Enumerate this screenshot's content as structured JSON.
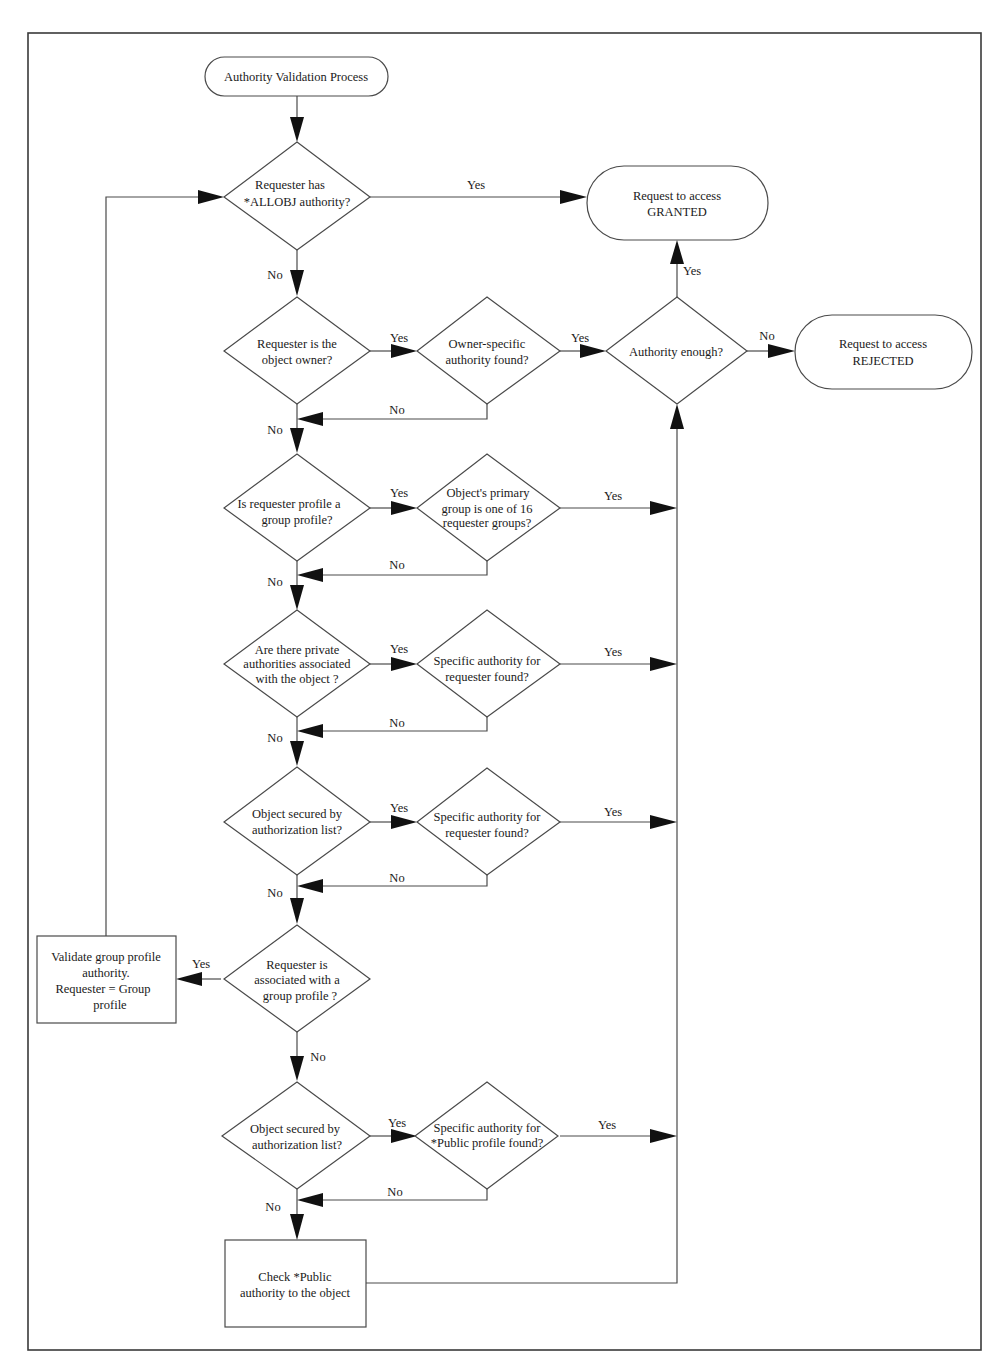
{
  "diagram": {
    "type": "flowchart",
    "title": "Authority Validation Process",
    "nodes": {
      "start": {
        "kind": "terminal",
        "lines": [
          "Authority Validation Process"
        ]
      },
      "d_allobj": {
        "kind": "decision",
        "lines": [
          "Requester has",
          "*ALLOBJ authority?"
        ]
      },
      "granted": {
        "kind": "terminal",
        "lines": [
          "Request to access",
          "GRANTED"
        ]
      },
      "d_owner": {
        "kind": "decision",
        "lines": [
          "Requester is the",
          "object owner?"
        ]
      },
      "d_owner_auth": {
        "kind": "decision",
        "lines": [
          "Owner-specific",
          "authority found?"
        ]
      },
      "d_enough": {
        "kind": "decision",
        "lines": [
          "Authority enough?"
        ]
      },
      "rejected": {
        "kind": "terminal",
        "lines": [
          "Request to access",
          "REJECTED"
        ]
      },
      "d_group_profile": {
        "kind": "decision",
        "lines": [
          "Is requester profile a",
          "group profile?"
        ]
      },
      "d_primary_group": {
        "kind": "decision",
        "lines": [
          "Object's primary",
          "group is one of 16",
          "requester groups?"
        ]
      },
      "d_private": {
        "kind": "decision",
        "lines": [
          "Are there private",
          "authorities associated",
          "with the object ?"
        ]
      },
      "d_private_auth": {
        "kind": "decision",
        "lines": [
          "Specific authority for",
          "requester found?"
        ]
      },
      "d_authlist1": {
        "kind": "decision",
        "lines": [
          "Object secured by",
          "authorization list?"
        ]
      },
      "d_authlist1_auth": {
        "kind": "decision",
        "lines": [
          "Specific authority for",
          "requester found?"
        ]
      },
      "d_assoc_group": {
        "kind": "decision",
        "lines": [
          "Requester is",
          "associated with a",
          "group profile ?"
        ]
      },
      "p_validate_group": {
        "kind": "process",
        "lines": [
          "Validate group profile",
          "authority.",
          "Requester = Group",
          "profile"
        ]
      },
      "d_authlist2": {
        "kind": "decision",
        "lines": [
          "Object secured by",
          "authorization list?"
        ]
      },
      "d_public_auth": {
        "kind": "decision",
        "lines": [
          "Specific authority for",
          "*Public profile found?"
        ]
      },
      "p_check_public": {
        "kind": "process",
        "lines": [
          "Check *Public",
          "authority to the object"
        ]
      }
    },
    "edge_labels": {
      "yes": "Yes",
      "no": "No"
    },
    "edges": [
      {
        "from": "start",
        "to": "d_allobj",
        "label": ""
      },
      {
        "from": "d_allobj",
        "to": "granted",
        "label": "Yes"
      },
      {
        "from": "d_allobj",
        "to": "d_owner",
        "label": "No"
      },
      {
        "from": "d_owner",
        "to": "d_owner_auth",
        "label": "Yes"
      },
      {
        "from": "d_owner_auth",
        "to": "d_enough",
        "label": "Yes"
      },
      {
        "from": "d_owner_auth",
        "to": "d_group_profile",
        "label": "No"
      },
      {
        "from": "d_owner",
        "to": "d_group_profile",
        "label": "No"
      },
      {
        "from": "d_enough",
        "to": "granted",
        "label": "Yes"
      },
      {
        "from": "d_enough",
        "to": "rejected",
        "label": "No"
      },
      {
        "from": "d_group_profile",
        "to": "d_primary_group",
        "label": "Yes"
      },
      {
        "from": "d_primary_group",
        "to": "d_enough",
        "label": "Yes"
      },
      {
        "from": "d_primary_group",
        "to": "d_private",
        "label": "No"
      },
      {
        "from": "d_group_profile",
        "to": "d_private",
        "label": "No"
      },
      {
        "from": "d_private",
        "to": "d_private_auth",
        "label": "Yes"
      },
      {
        "from": "d_private_auth",
        "to": "d_enough",
        "label": "Yes"
      },
      {
        "from": "d_private_auth",
        "to": "d_authlist1",
        "label": "No"
      },
      {
        "from": "d_private",
        "to": "d_authlist1",
        "label": "No"
      },
      {
        "from": "d_authlist1",
        "to": "d_authlist1_auth",
        "label": "Yes"
      },
      {
        "from": "d_authlist1_auth",
        "to": "d_enough",
        "label": "Yes"
      },
      {
        "from": "d_authlist1_auth",
        "to": "d_assoc_group",
        "label": "No"
      },
      {
        "from": "d_authlist1",
        "to": "d_assoc_group",
        "label": "No"
      },
      {
        "from": "d_assoc_group",
        "to": "p_validate_group",
        "label": "Yes"
      },
      {
        "from": "p_validate_group",
        "to": "d_allobj",
        "label": ""
      },
      {
        "from": "d_assoc_group",
        "to": "d_authlist2",
        "label": "No"
      },
      {
        "from": "d_authlist2",
        "to": "d_public_auth",
        "label": "Yes"
      },
      {
        "from": "d_public_auth",
        "to": "d_enough",
        "label": "Yes"
      },
      {
        "from": "d_public_auth",
        "to": "p_check_public",
        "label": "No"
      },
      {
        "from": "d_authlist2",
        "to": "p_check_public",
        "label": "No"
      },
      {
        "from": "p_check_public",
        "to": "d_enough",
        "label": ""
      }
    ]
  }
}
